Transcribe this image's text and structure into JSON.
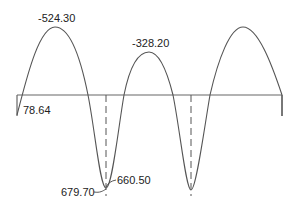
{
  "diagram": {
    "type": "bending-moment-diagram",
    "colors": {
      "curve": "#555555",
      "beam": "#666666",
      "text": "#222222",
      "background": "#ffffff"
    },
    "labels": {
      "peak_left": "-524.30",
      "peak_middle": "-328.20",
      "end_left": "78.64",
      "trough_left_a": "679.70",
      "trough_left_b": "660.50"
    }
  }
}
